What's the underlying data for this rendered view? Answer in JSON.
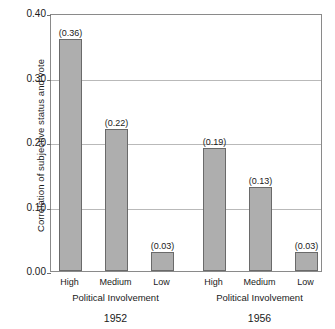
{
  "chart_data": {
    "type": "bar",
    "title": "",
    "xlabel": "Political Involvement",
    "ylabel": "Correlation of subjective status and vote",
    "ylim": [
      0.0,
      0.4
    ],
    "ytick_labels": [
      "0.40",
      "0.30",
      "0.20",
      "0.10",
      "0.00"
    ],
    "ytick_values": [
      0.4,
      0.3,
      0.2,
      0.1,
      0.0
    ],
    "grid": true,
    "legend": "none",
    "categories": [
      "High",
      "Medium",
      "Low"
    ],
    "groups": [
      {
        "name": "1952",
        "axis_title": "Political Involvement",
        "categories": [
          "High",
          "Medium",
          "Low"
        ],
        "values": [
          0.36,
          0.22,
          0.03
        ],
        "value_labels": [
          "(0.36)",
          "(0.22)",
          "(0.03)"
        ]
      },
      {
        "name": "1956",
        "axis_title": "Political Involvement",
        "categories": [
          "High",
          "Medium",
          "Low"
        ],
        "values": [
          0.19,
          0.13,
          0.03
        ],
        "value_labels": [
          "(0.19)",
          "(0.13)",
          "(0.03)"
        ]
      }
    ],
    "bar_color": "#aeaeae",
    "bar_edge_color": "#6a6a6a",
    "grid_color": "#b9b9b9",
    "frame_color": "#8a8a8a"
  }
}
